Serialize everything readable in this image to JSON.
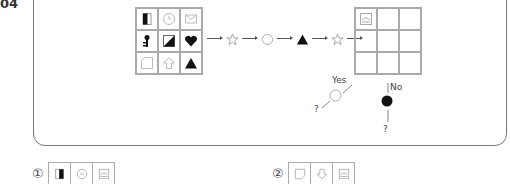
{
  "question": {
    "number": "04"
  },
  "source_grid": {
    "cells": [
      {
        "icon": "half-filled-rectangle-icon"
      },
      {
        "icon": "clock-icon"
      },
      {
        "icon": "envelope-icon"
      },
      {
        "icon": "key-icon"
      },
      {
        "icon": "diagonal-half-square-icon"
      },
      {
        "icon": "heart-icon"
      },
      {
        "icon": "folded-corner-square-icon"
      },
      {
        "icon": "up-arrow-outline-icon"
      },
      {
        "icon": "filled-triangle-icon"
      }
    ]
  },
  "flow": {
    "steps": [
      "star-outline-icon",
      "circle-outline-icon",
      "filled-triangle-icon",
      "star-outline-icon"
    ]
  },
  "target_grid": {
    "cells": [
      {
        "icon": "image-frame-icon"
      },
      {
        "icon": ""
      },
      {
        "icon": ""
      },
      {
        "icon": ""
      },
      {
        "icon": ""
      },
      {
        "icon": ""
      },
      {
        "icon": ""
      },
      {
        "icon": ""
      },
      {
        "icon": ""
      }
    ]
  },
  "branches": {
    "yes_label": "Yes",
    "no_label": "No",
    "yes_result": "?",
    "no_result": "?"
  },
  "options": [
    {
      "number": "①",
      "icons": [
        "half-filled-rectangle-icon",
        "circle-dash-icon",
        "image-frame-icon"
      ]
    },
    {
      "number": "②",
      "icons": [
        "folded-corner-square-icon",
        "down-arrow-outline-icon",
        "image-frame-icon"
      ]
    }
  ]
}
